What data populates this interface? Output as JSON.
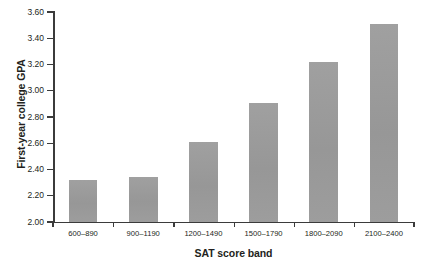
{
  "chart_data": {
    "type": "bar",
    "title": "",
    "xlabel": "SAT score band",
    "ylabel": "First-year college GPA",
    "categories": [
      "600–890",
      "900–1190",
      "1200–1490",
      "1500–1790",
      "1800–2090",
      "2100–2400"
    ],
    "values": [
      2.32,
      2.34,
      2.61,
      2.91,
      3.22,
      3.51
    ],
    "series": [
      {
        "name": "First-year college GPA",
        "values": [
          2.32,
          2.34,
          2.61,
          2.91,
          3.22,
          3.51
        ]
      }
    ],
    "ylim": [
      2.0,
      3.6
    ],
    "ytick_step": 0.2,
    "ytick_labels": [
      "2.00",
      "2.20",
      "2.40",
      "2.60",
      "2.80",
      "3.00",
      "3.20",
      "3.40",
      "3.60"
    ],
    "ytick_values": [
      2.0,
      2.2,
      2.4,
      2.6,
      2.8,
      3.0,
      3.2,
      3.4,
      3.6
    ],
    "grid": false,
    "legend": false,
    "legend_position": "none",
    "bar_color": "#9b9b9b",
    "axis_color": "#3b3b3b",
    "text_color": "#231f20",
    "background_color": "#ffffff"
  }
}
